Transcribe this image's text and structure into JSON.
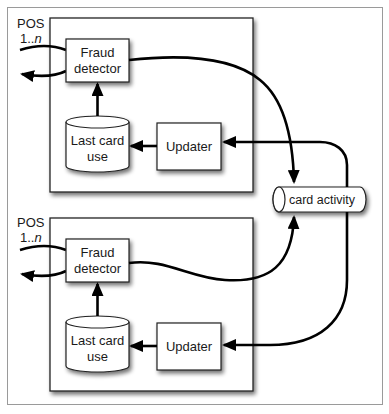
{
  "diagram": {
    "instances": [
      {
        "pos_label": "POS",
        "pos_range_prefix": "1..",
        "pos_range_var": "n",
        "fraud_detector_line1": "Fraud",
        "fraud_detector_line2": "detector",
        "last_card_use_line1": "Last card",
        "last_card_use_line2": "use",
        "updater_label": "Updater"
      },
      {
        "pos_label": "POS",
        "pos_range_prefix": "1..",
        "pos_range_var": "n",
        "fraud_detector_line1": "Fraud",
        "fraud_detector_line2": "detector",
        "last_card_use_line1": "Last card",
        "last_card_use_line2": "use",
        "updater_label": "Updater"
      }
    ],
    "queue": {
      "label": "card activity"
    },
    "colors": {
      "frame_border": "#9a9a9a",
      "box_border": "#222222",
      "arrow": "#000000",
      "fill": "#ffffff"
    }
  }
}
